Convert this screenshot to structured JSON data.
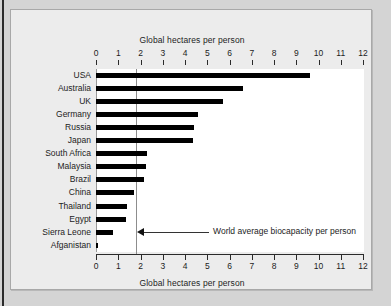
{
  "chart_data": {
    "type": "bar",
    "orientation": "horizontal",
    "title": "",
    "xlabel": "Global hectares per person",
    "ylabel": "",
    "xlim": [
      0,
      12
    ],
    "xticks": [
      0,
      1,
      2,
      3,
      4,
      5,
      6,
      7,
      8,
      9,
      10,
      11,
      12
    ],
    "xtick_labels": [
      "0",
      "1",
      "2",
      "3",
      "4",
      "5",
      "6",
      "7",
      "8",
      "9",
      "10",
      "11",
      "12"
    ],
    "grid": false,
    "legend": null,
    "axis_titles": {
      "top": "Global hectares per person",
      "bottom": "Global hectares per person"
    },
    "categories": [
      "USA",
      "Australia",
      "UK",
      "Germany",
      "Russia",
      "Japan",
      "South Africa",
      "Malaysia",
      "Brazil",
      "China",
      "Thailand",
      "Egypt",
      "Sierra Leone",
      "Afganistan"
    ],
    "values": [
      9.6,
      6.6,
      5.7,
      4.6,
      4.4,
      4.35,
      2.3,
      2.25,
      2.15,
      1.7,
      1.4,
      1.35,
      0.75,
      0.1
    ],
    "annotations": [
      {
        "label": "World average biocapacity per person",
        "value": 1.8,
        "type": "reference-line"
      }
    ],
    "colors": {
      "bar": "#000000",
      "reference_line": "#8d8d8d",
      "plot_background": "#ffffff",
      "figure_background": "#ececec",
      "page_background": "#d4d4d4",
      "text": "#1c1c1c"
    }
  }
}
